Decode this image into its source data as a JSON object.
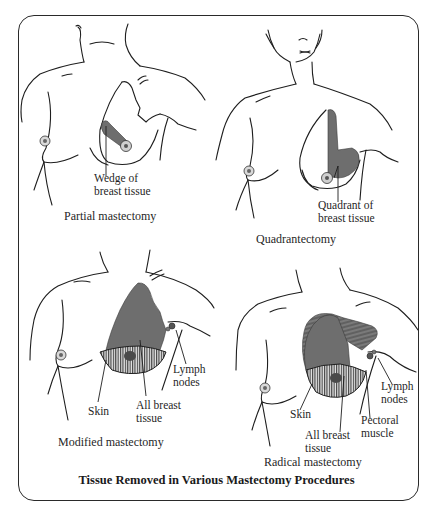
{
  "figure": {
    "title": "Tissue Removed in Various Mastectomy Procedures",
    "colors": {
      "line": "#1e1e1e",
      "removed_tissue": "#6e6e6e",
      "hatch": "#2a2a2a",
      "background": "#ffffff"
    },
    "panels": [
      {
        "id": "partial",
        "caption": "Partial mastectomy",
        "labels": [
          {
            "text_lines": [
              "Wedge of",
              "breast tissue"
            ]
          }
        ]
      },
      {
        "id": "quadrantectomy",
        "caption": "Quadrantectomy",
        "labels": [
          {
            "text_lines": [
              "Quadrant of",
              "breast tissue"
            ]
          }
        ]
      },
      {
        "id": "modified",
        "caption": "Modified mastectomy",
        "labels": [
          {
            "text_lines": [
              "Lymph",
              "nodes"
            ]
          },
          {
            "text_lines": [
              "Skin"
            ]
          },
          {
            "text_lines": [
              "All breast",
              "tissue"
            ]
          }
        ]
      },
      {
        "id": "radical",
        "caption": "Radical mastectomy",
        "labels": [
          {
            "text_lines": [
              "Lymph",
              "nodes"
            ]
          },
          {
            "text_lines": [
              "Skin"
            ]
          },
          {
            "text_lines": [
              "Pectoral",
              "muscle"
            ]
          },
          {
            "text_lines": [
              "All breast",
              "tissue"
            ]
          }
        ]
      }
    ]
  }
}
